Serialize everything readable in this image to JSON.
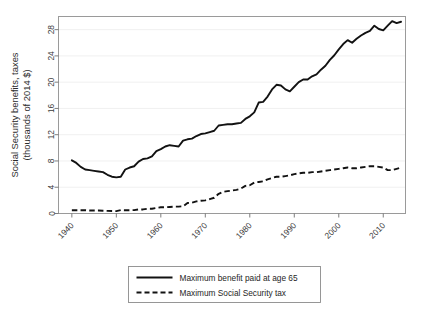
{
  "chart_data": {
    "type": "line",
    "title": "",
    "subtitle": "",
    "xlabel": "",
    "ylabel": "Social Security benefits, taxes\n(thousands of 2014 $)",
    "ylabel_line1": "Social Security benefits, taxes",
    "ylabel_line2": "(thousands of 2014 $)",
    "xlim": [
      1937,
      2015
    ],
    "ylim": [
      0,
      30
    ],
    "yticks": [
      0,
      4,
      8,
      12,
      16,
      20,
      24,
      28
    ],
    "ytick_labels": [
      "0",
      "4",
      "8",
      "12",
      "16",
      "20",
      "24",
      "28"
    ],
    "xticks": [
      1940,
      1950,
      1960,
      1970,
      1980,
      1990,
      2000,
      2010
    ],
    "xtick_labels": [
      "1940",
      "1950",
      "1960",
      "1970",
      "1980",
      "1990",
      "2000",
      "2010"
    ],
    "xtick_label_rotation": 45,
    "grid": "horizontal-faint",
    "legend_position": "below-axes",
    "line_color": "#121212",
    "series": [
      {
        "name": "Maximum benefit paid at age 65",
        "style": "solid",
        "x": [
          1940,
          1941,
          1942,
          1943,
          1944,
          1945,
          1946,
          1947,
          1948,
          1949,
          1950,
          1951,
          1952,
          1953,
          1954,
          1955,
          1956,
          1957,
          1958,
          1959,
          1960,
          1961,
          1962,
          1963,
          1964,
          1965,
          1966,
          1967,
          1968,
          1969,
          1970,
          1971,
          1972,
          1973,
          1974,
          1975,
          1976,
          1977,
          1978,
          1979,
          1980,
          1981,
          1982,
          1983,
          1984,
          1985,
          1986,
          1987,
          1988,
          1989,
          1990,
          1991,
          1992,
          1993,
          1994,
          1995,
          1996,
          1997,
          1998,
          1999,
          2000,
          2001,
          2002,
          2003,
          2004,
          2005,
          2006,
          2007,
          2008,
          2009,
          2010,
          2011,
          2012,
          2013,
          2014
        ],
        "values": [
          8.1,
          7.7,
          7.1,
          6.7,
          6.6,
          6.5,
          6.4,
          6.3,
          5.9,
          5.6,
          5.5,
          5.6,
          6.7,
          7.0,
          7.2,
          7.9,
          8.3,
          8.4,
          8.7,
          9.5,
          9.8,
          10.2,
          10.4,
          10.3,
          10.2,
          11.1,
          11.3,
          11.4,
          11.8,
          12.1,
          12.2,
          12.4,
          12.6,
          13.4,
          13.5,
          13.6,
          13.6,
          13.7,
          13.8,
          14.4,
          14.8,
          15.4,
          16.9,
          17.0,
          17.8,
          18.9,
          19.6,
          19.5,
          18.9,
          18.6,
          19.3,
          20.0,
          20.4,
          20.4,
          20.9,
          21.2,
          21.9,
          22.5,
          23.4,
          24.1,
          25.0,
          25.8,
          26.4,
          26.0,
          26.6,
          27.1,
          27.5,
          27.8,
          28.6,
          28.1,
          27.9,
          28.6,
          29.3,
          29.0,
          29.2
        ]
      },
      {
        "name": "Maximum Social Security tax",
        "style": "dashed",
        "x": [
          1940,
          1941,
          1942,
          1943,
          1944,
          1945,
          1946,
          1947,
          1948,
          1949,
          1950,
          1951,
          1952,
          1953,
          1954,
          1955,
          1956,
          1957,
          1958,
          1959,
          1960,
          1961,
          1962,
          1963,
          1964,
          1965,
          1966,
          1967,
          1968,
          1969,
          1970,
          1971,
          1972,
          1973,
          1974,
          1975,
          1976,
          1977,
          1978,
          1979,
          1980,
          1981,
          1982,
          1983,
          1984,
          1985,
          1986,
          1987,
          1988,
          1989,
          1990,
          1991,
          1992,
          1993,
          1994,
          1995,
          1996,
          1997,
          1998,
          1999,
          2000,
          2001,
          2002,
          2003,
          2004,
          2005,
          2006,
          2007,
          2008,
          2009,
          2010,
          2011,
          2012,
          2013,
          2014
        ],
        "values": [
          0.5,
          0.5,
          0.5,
          0.5,
          0.45,
          0.45,
          0.45,
          0.42,
          0.4,
          0.38,
          0.36,
          0.52,
          0.5,
          0.5,
          0.52,
          0.62,
          0.62,
          0.72,
          0.72,
          0.85,
          0.95,
          0.95,
          1.0,
          1.05,
          1.05,
          1.1,
          1.6,
          1.65,
          1.85,
          1.95,
          2.0,
          2.2,
          2.4,
          3.0,
          3.3,
          3.4,
          3.5,
          3.6,
          3.8,
          4.2,
          4.3,
          4.7,
          4.8,
          4.9,
          5.2,
          5.4,
          5.6,
          5.6,
          5.7,
          5.8,
          6.0,
          6.1,
          6.2,
          6.2,
          6.3,
          6.3,
          6.4,
          6.5,
          6.6,
          6.7,
          6.8,
          6.9,
          7.0,
          6.9,
          6.9,
          7.0,
          7.1,
          7.2,
          7.2,
          7.1,
          7.0,
          6.6,
          6.6,
          6.8,
          7.0
        ]
      }
    ]
  },
  "legend": {
    "items": [
      {
        "label": "Maximum benefit paid at age 65",
        "style": "solid"
      },
      {
        "label": "Maximum Social Security tax",
        "style": "dashed"
      }
    ]
  }
}
